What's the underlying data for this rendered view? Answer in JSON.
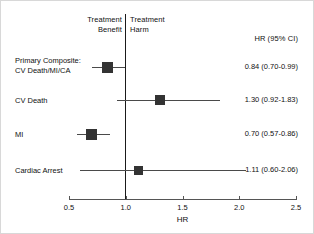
{
  "chart_data": {
    "type": "scatter",
    "subtype": "forest-plot",
    "title": "",
    "xlabel": "HR",
    "ylabel": "",
    "xlim": [
      0.5,
      2.5
    ],
    "xticks": [
      "0.5",
      "1.0",
      "1.5",
      "2.0",
      "2.5"
    ],
    "xtick_values": [
      0.5,
      1.0,
      1.5,
      2.0,
      2.5
    ],
    "grid": false,
    "null_line": 1.0,
    "effect_column_header": "HR (95% CI)",
    "left_region_label": "Treatment\nBenefit",
    "right_region_label": "Treatment\nHarm",
    "rows": [
      {
        "label": "Primary Composite:\nCV Death/MI/CA",
        "estimate": 0.84,
        "ci_low": 0.7,
        "ci_high": 0.99,
        "estimate_text": "0.84 (0.70-0.99)",
        "marker_size": 11
      },
      {
        "label": "CV Death",
        "estimate": 1.3,
        "ci_low": 0.92,
        "ci_high": 1.83,
        "estimate_text": "1.30 (0.92-1.83)",
        "marker_size": 10
      },
      {
        "label": "MI",
        "estimate": 0.7,
        "ci_low": 0.57,
        "ci_high": 0.86,
        "estimate_text": "0.70 (0.57-0.86)",
        "marker_size": 11
      },
      {
        "label": "Cardiac Arrest",
        "estimate": 1.11,
        "ci_low": 0.6,
        "ci_high": 2.06,
        "estimate_text": "1.11 (0.60-2.06)",
        "marker_size": 9
      }
    ],
    "colors": {
      "marker": "#333333",
      "whisker": "#4a4a4a",
      "null_line": "#1a1a1a",
      "axis": "#555555",
      "text": "#111111",
      "background": "#ffffff",
      "frame": "#d8d8d8"
    }
  },
  "header": {
    "benefit": "Treatment\nBenefit",
    "harm": "Treatment\nHarm",
    "ci_column": "HR (95% CI)"
  },
  "axis": {
    "title": "HR",
    "ticks": [
      "0.5",
      "1.0",
      "1.5",
      "2.0",
      "2.5"
    ]
  }
}
